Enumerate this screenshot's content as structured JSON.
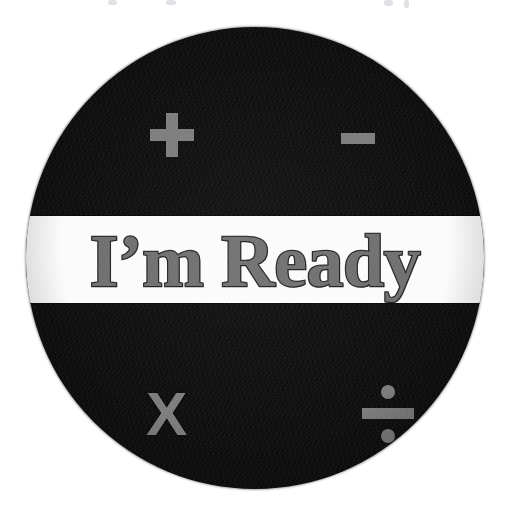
{
  "page": {
    "background_color": "#ffffff",
    "width": 505,
    "height": 528
  },
  "badge": {
    "shape": "circle",
    "fill_color": "#0d0d0d",
    "diameter_px": 458,
    "label": "calculator-operations-badge"
  },
  "banner": {
    "text": "I’m Ready",
    "fill_color": "#6e6e6e",
    "outline_color": "#2a2a2a",
    "background_color": "#fbfbfb"
  },
  "operators": {
    "color": "#7c7c7c",
    "items": [
      {
        "name": "plus",
        "glyph": "+",
        "position": "top-left"
      },
      {
        "name": "minus",
        "glyph": "−",
        "position": "top-right"
      },
      {
        "name": "multiply",
        "glyph": "X",
        "position": "bottom-left"
      },
      {
        "name": "divide",
        "glyph": "÷",
        "position": "bottom-right"
      }
    ],
    "multiply_glyph": "X"
  }
}
